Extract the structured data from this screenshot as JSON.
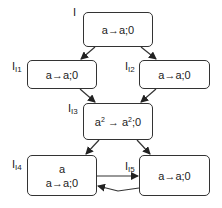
{
  "diagram": {
    "nodes": [
      {
        "id": "I",
        "label_main": "I",
        "label_sub": "",
        "text": "a→a;0"
      },
      {
        "id": "I1",
        "label_main": "I",
        "label_sub": "I1",
        "text": "a→a;0"
      },
      {
        "id": "I2",
        "label_main": "I",
        "label_sub": "I2",
        "text": "a→a;0"
      },
      {
        "id": "I3",
        "label_main": "I",
        "label_sub": "I3",
        "text_base1": "a",
        "text_sup1": "2",
        "text_arrow": " → ",
        "text_base2": "a",
        "text_sup2": "2",
        "text_tail": ";0"
      },
      {
        "id": "I4",
        "label_main": "I",
        "label_sub": "I4",
        "line1": "a",
        "text": "a→a;0"
      },
      {
        "id": "I5",
        "label_main": "I",
        "label_sub": "I5",
        "text": "a→a;0"
      }
    ],
    "edges": [
      {
        "from": "I",
        "to": "I1"
      },
      {
        "from": "I",
        "to": "I2"
      },
      {
        "from": "I1",
        "to": "I3"
      },
      {
        "from": "I2",
        "to": "I3"
      },
      {
        "from": "I3",
        "to": "I4"
      },
      {
        "from": "I3",
        "to": "I5"
      },
      {
        "from": "I4",
        "to": "I5"
      },
      {
        "from": "I5",
        "to": "I4"
      }
    ],
    "colors": {
      "stroke": "#333333",
      "background": "#ffffff"
    }
  }
}
